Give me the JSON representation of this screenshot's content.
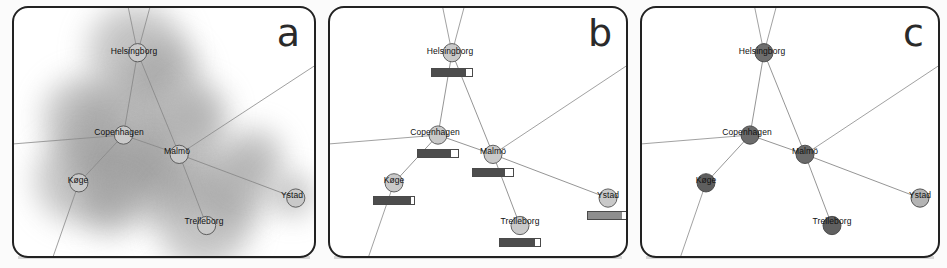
{
  "figure": {
    "width": 947,
    "height": 268,
    "background": "#ffffff",
    "panel_border_color": "#222222",
    "edge_color": "#8a8a8a"
  },
  "panels": [
    {
      "id": "a",
      "letter": "a",
      "encoding": "blurred-density-blob-overlay",
      "node_style": "light-gray-circle-outline",
      "node_fill": "#c9c9c9",
      "node_stroke": "#555555",
      "has_gauges": false,
      "has_blobs": true
    },
    {
      "id": "b",
      "letter": "b",
      "encoding": "horizontal-bar-gauge-below-node",
      "node_style": "light-gray-circle-outline",
      "node_fill": "#c9c9c9",
      "node_stroke": "#555555",
      "has_gauges": true,
      "has_blobs": false
    },
    {
      "id": "c",
      "letter": "c",
      "encoding": "node-darkness-luminance",
      "node_style": "filled-gray-by-value",
      "node_stroke": "#444444",
      "has_gauges": false,
      "has_blobs": false
    }
  ],
  "chart_data": {
    "type": "diagram",
    "nodes": [
      {
        "id": "helsingborg",
        "label": "Helsingborg",
        "x": 122,
        "y": 44,
        "label_dx": -2,
        "label_dy": -1,
        "value_b": 0.86,
        "value_c": 0.6,
        "gauge_fill": "#4d4d4d",
        "node_c_fill": "#6e6e6e"
      },
      {
        "id": "copenhagen",
        "label": "Copenhagen",
        "x": 108,
        "y": 125,
        "label_dx": -3,
        "label_dy": -1,
        "value_b": 0.82,
        "value_c": 0.58,
        "gauge_fill": "#4d4d4d",
        "node_c_fill": "#6b6b6b"
      },
      {
        "id": "malmo",
        "label": "Malmö",
        "x": 163,
        "y": 144,
        "label_dx": 0,
        "label_dy": -1,
        "value_b": 0.8,
        "value_c": 0.62,
        "gauge_fill": "#4d4d4d",
        "node_c_fill": "#6a6a6a"
      },
      {
        "id": "koge",
        "label": "Køge",
        "x": 64,
        "y": 172,
        "label_dx": 0,
        "label_dy": 0,
        "value_b": 0.92,
        "value_c": 0.72,
        "gauge_fill": "#4d4d4d",
        "node_c_fill": "#5e5e5e"
      },
      {
        "id": "trelleborg",
        "label": "Trelleborg",
        "x": 190,
        "y": 214,
        "label_dx": 0,
        "label_dy": -1,
        "value_b": 0.88,
        "value_c": 0.7,
        "gauge_fill": "#4d4d4d",
        "node_c_fill": "#606060"
      },
      {
        "id": "ystad",
        "label": "Ystad",
        "x": 278,
        "y": 187,
        "label_dx": 0,
        "label_dy": 0,
        "value_b": 0.85,
        "value_c": 0.22,
        "gauge_fill": "#8e8e8e",
        "node_c_fill": "#b4b4b4"
      }
    ],
    "edges": [
      {
        "from": "helsingborg",
        "to": "copenhagen"
      },
      {
        "from": "helsingborg",
        "to": "malmo"
      },
      {
        "from": "copenhagen",
        "to": "malmo"
      },
      {
        "from": "copenhagen",
        "to": "koge"
      },
      {
        "from": "malmo",
        "to": "trelleborg"
      },
      {
        "from": "malmo",
        "to": "ystad"
      }
    ],
    "open_edges": [
      {
        "from": "helsingborg",
        "to_x": 112,
        "to_y": -4,
        "note": "edge exits top"
      },
      {
        "from": "helsingborg",
        "to_x": 135,
        "to_y": -4,
        "note": "edge exits top"
      },
      {
        "from": "copenhagen",
        "to_x": -4,
        "to_y": 134,
        "note": "edge exits left"
      },
      {
        "from": "koge",
        "to_x": 36,
        "to_y": 252,
        "note": "edge exits bottom"
      },
      {
        "from": "malmo",
        "to_x": 304,
        "to_y": 52,
        "note": "edge exits upper right"
      }
    ],
    "blobs": [
      {
        "x": 122,
        "y": 44,
        "r": 58
      },
      {
        "x": 150,
        "y": 70,
        "r": 46
      },
      {
        "x": 108,
        "y": 125,
        "r": 62
      },
      {
        "x": 70,
        "y": 110,
        "r": 50
      },
      {
        "x": 163,
        "y": 144,
        "r": 58
      },
      {
        "x": 64,
        "y": 172,
        "r": 52
      },
      {
        "x": 100,
        "y": 160,
        "r": 46
      },
      {
        "x": 140,
        "y": 176,
        "r": 48
      },
      {
        "x": 190,
        "y": 214,
        "r": 56
      },
      {
        "x": 218,
        "y": 182,
        "r": 44
      },
      {
        "x": 240,
        "y": 150,
        "r": 36
      },
      {
        "x": 278,
        "y": 187,
        "r": 26
      },
      {
        "x": 186,
        "y": 104,
        "r": 34
      },
      {
        "x": 96,
        "y": 200,
        "r": 34
      }
    ],
    "gauge_geometry": {
      "width": 42,
      "height": 9,
      "offset_y": 16,
      "note": "bar sits below node centre"
    },
    "node_radius": 9,
    "xlim": [
      0,
      296
    ],
    "ylim": [
      0,
      248
    ],
    "grid": false,
    "legend": ""
  }
}
